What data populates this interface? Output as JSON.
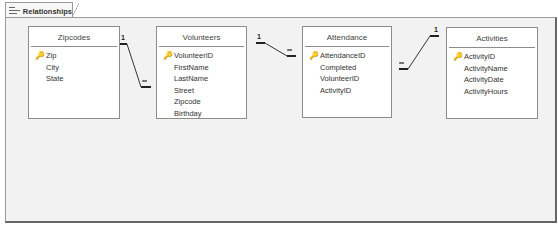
{
  "tab": {
    "title": "Relationships",
    "icon": "relationships-icon"
  },
  "tables": [
    {
      "name": "Zipcodes",
      "fields": [
        {
          "name": "Zip",
          "key": true
        },
        {
          "name": "City",
          "key": false
        },
        {
          "name": "State",
          "key": false
        }
      ]
    },
    {
      "name": "Volunteers",
      "fields": [
        {
          "name": "VolunteerID",
          "key": true
        },
        {
          "name": "FirstName",
          "key": false
        },
        {
          "name": "LastName",
          "key": false
        },
        {
          "name": "Street",
          "key": false
        },
        {
          "name": "Zipcode",
          "key": false
        },
        {
          "name": "Birthday",
          "key": false
        }
      ]
    },
    {
      "name": "Attendance",
      "fields": [
        {
          "name": "AttendanceID",
          "key": true
        },
        {
          "name": "Completed",
          "key": false
        },
        {
          "name": "VolunteerID",
          "key": false
        },
        {
          "name": "ActivityID",
          "key": false
        }
      ]
    },
    {
      "name": "Activities",
      "fields": [
        {
          "name": "ActivityID",
          "key": true
        },
        {
          "name": "ActivityName",
          "key": false
        },
        {
          "name": "ActivityDate",
          "key": false
        },
        {
          "name": "ActivityHours",
          "key": false
        }
      ]
    }
  ],
  "relationships": [
    {
      "from": "Zipcodes.Zip",
      "to": "Volunteers.Zipcode",
      "one_label": "1",
      "many_label": "∞"
    },
    {
      "from": "Volunteers.VolunteerID",
      "to": "Attendance.VolunteerID",
      "one_label": "1",
      "many_label": "∞"
    },
    {
      "from": "Activities.ActivityID",
      "to": "Attendance.ActivityID",
      "one_label": "1",
      "many_label": "∞"
    }
  ],
  "key_icon": "🔑"
}
